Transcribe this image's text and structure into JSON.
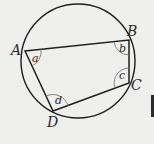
{
  "diagram": {
    "type": "cyclic-quadrilateral",
    "circle": {
      "cx": 78,
      "cy": 61,
      "r": 57
    },
    "vertices": [
      {
        "label": "A",
        "x": 25,
        "y": 51
      },
      {
        "label": "B",
        "x": 129,
        "y": 40
      },
      {
        "label": "C",
        "x": 129,
        "y": 83
      },
      {
        "label": "D",
        "x": 53,
        "y": 111
      }
    ],
    "angles": [
      {
        "vertex": "A",
        "label": "a"
      },
      {
        "vertex": "B",
        "label": "b"
      },
      {
        "vertex": "C",
        "label": "c"
      },
      {
        "vertex": "D",
        "label": "d"
      }
    ],
    "colors": {
      "background": "#efefed",
      "stroke": "#1e1e1e",
      "arc": "#777777"
    }
  }
}
